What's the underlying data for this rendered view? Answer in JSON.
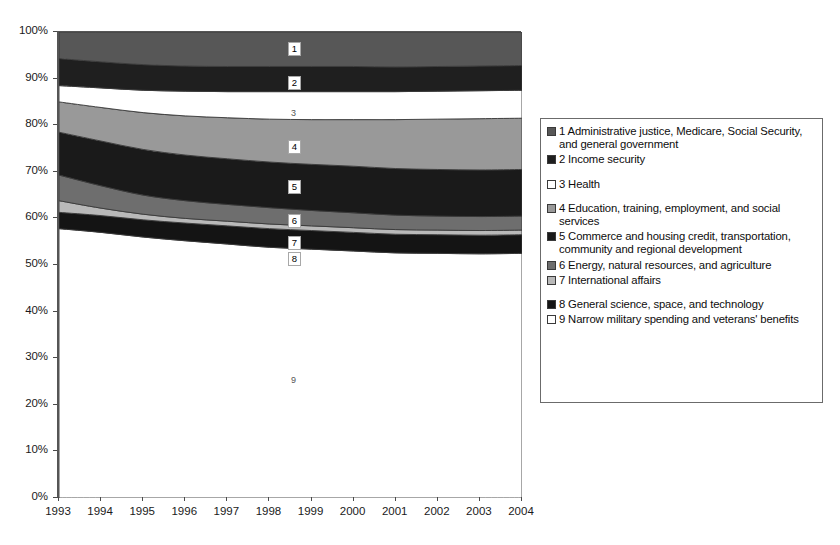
{
  "chart_data": {
    "type": "area",
    "stacked": true,
    "normalized": true,
    "title": "",
    "subtitle": "",
    "xlabel": "",
    "ylabel": "",
    "xlim": [
      1993,
      2004
    ],
    "ylim": [
      0,
      100
    ],
    "grid": false,
    "legend_position": "right",
    "x": [
      1993,
      1994,
      1995,
      1996,
      1997,
      1998,
      1999,
      2000,
      2001,
      2002,
      2003,
      2004
    ],
    "x_tick_labels": [
      "1993",
      "1994",
      "1995",
      "1996",
      "1997",
      "1998",
      "1999",
      "2000",
      "2001",
      "2002",
      "2003",
      "2004"
    ],
    "y_tick_labels": [
      "0%",
      "10%",
      "20%",
      "30%",
      "40%",
      "50%",
      "60%",
      "70%",
      "80%",
      "90%",
      "100%"
    ],
    "y_ticks": [
      0,
      10,
      20,
      30,
      40,
      50,
      60,
      70,
      80,
      90,
      100
    ],
    "series": [
      {
        "id": 9,
        "name": "Narrow military spending and veterans' benefits",
        "color": "#ffffff",
        "values": [
          57.8,
          57.0,
          56.0,
          55.2,
          54.5,
          53.8,
          53.4,
          53.0,
          52.6,
          52.5,
          52.4,
          52.5
        ],
        "cumulative_top": [
          57.8,
          57.0,
          56.0,
          55.2,
          54.5,
          53.8,
          53.4,
          53.0,
          52.6,
          52.5,
          52.4,
          52.5
        ]
      },
      {
        "id": 8,
        "name": "General science, space, and technology",
        "color": "#141414",
        "values": [
          3.5,
          3.6,
          3.7,
          3.8,
          3.9,
          4.0,
          4.0,
          4.0,
          4.0,
          4.0,
          4.0,
          4.0
        ],
        "cumulative_top": [
          61.3,
          60.6,
          59.7,
          59.0,
          58.4,
          57.8,
          57.4,
          57.0,
          56.6,
          56.5,
          56.4,
          56.5
        ]
      },
      {
        "id": 7,
        "name": "International affairs",
        "color": "#b9b9b9",
        "values": [
          2.5,
          1.6,
          1.2,
          1.0,
          1.0,
          1.0,
          1.0,
          1.0,
          1.0,
          1.0,
          1.0,
          1.0
        ],
        "cumulative_top": [
          63.8,
          62.2,
          60.9,
          60.0,
          59.4,
          58.8,
          58.4,
          58.0,
          57.6,
          57.5,
          57.4,
          57.5
        ]
      },
      {
        "id": 6,
        "name": "Energy, natural resources,  and agriculture",
        "color": "#6e6e6e",
        "values": [
          5.5,
          4.8,
          4.1,
          3.8,
          3.6,
          3.5,
          3.3,
          3.2,
          3.1,
          3.0,
          3.0,
          3.0
        ],
        "cumulative_top": [
          69.3,
          67.0,
          65.0,
          63.8,
          63.0,
          62.3,
          61.7,
          61.2,
          60.7,
          60.5,
          60.4,
          60.5
        ]
      },
      {
        "id": 5,
        "name": "Commerce and housing credit, transportation, community and regional development",
        "color": "#1a1a1a",
        "values": [
          9.2,
          9.6,
          9.8,
          9.8,
          9.8,
          9.8,
          9.9,
          10.0,
          10.0,
          10.0,
          10.0,
          10.0
        ],
        "cumulative_top": [
          78.5,
          76.6,
          74.8,
          73.6,
          72.8,
          72.1,
          71.6,
          71.2,
          70.7,
          70.5,
          70.4,
          70.5
        ]
      },
      {
        "id": 4,
        "name": "Education, training, employment, and social services",
        "color": "#999999",
        "values": [
          6.5,
          7.2,
          7.9,
          8.4,
          8.8,
          9.2,
          9.6,
          10.0,
          10.5,
          10.8,
          11.0,
          11.0
        ],
        "cumulative_top": [
          85.0,
          83.8,
          82.7,
          82.0,
          81.6,
          81.3,
          81.2,
          81.2,
          81.2,
          81.3,
          81.4,
          81.5
        ]
      },
      {
        "id": 3,
        "name": "Health",
        "color": "#ffffff",
        "values": [
          3.5,
          4.2,
          4.8,
          5.3,
          5.6,
          5.9,
          6.0,
          6.0,
          6.0,
          6.0,
          6.0,
          6.0
        ],
        "cumulative_top": [
          88.5,
          88.0,
          87.5,
          87.3,
          87.2,
          87.2,
          87.2,
          87.2,
          87.2,
          87.3,
          87.4,
          87.5
        ]
      },
      {
        "id": 2,
        "name": "Income security",
        "color": "#1f1f1f",
        "values": [
          5.8,
          5.6,
          5.5,
          5.4,
          5.4,
          5.4,
          5.4,
          5.4,
          5.3,
          5.3,
          5.3,
          5.3
        ],
        "cumulative_top": [
          94.3,
          93.6,
          93.0,
          92.7,
          92.6,
          92.6,
          92.6,
          92.6,
          92.5,
          92.6,
          92.7,
          92.8
        ]
      },
      {
        "id": 1,
        "name": "Administrative justice, Medicare, Social Security, and general government",
        "color": "#575757",
        "values": [
          5.7,
          6.4,
          7.0,
          7.3,
          7.4,
          7.4,
          7.4,
          7.4,
          7.5,
          7.4,
          7.3,
          7.2
        ],
        "cumulative_top": [
          100,
          100,
          100,
          100,
          100,
          100,
          100,
          100,
          100,
          100,
          100,
          100
        ]
      }
    ],
    "band_number_labels": [
      {
        "id": "1",
        "text": "1",
        "x_px": 288,
        "y_px": 42,
        "boxed": true
      },
      {
        "id": "2",
        "text": "2",
        "x_px": 288,
        "y_px": 76,
        "boxed": true
      },
      {
        "id": "3",
        "text": "3",
        "x_px": 288,
        "y_px": 107,
        "boxed": false
      },
      {
        "id": "4",
        "text": "4",
        "x_px": 288,
        "y_px": 140,
        "boxed": true
      },
      {
        "id": "5",
        "text": "5",
        "x_px": 288,
        "y_px": 180,
        "boxed": true
      },
      {
        "id": "6",
        "text": "6",
        "x_px": 288,
        "y_px": 214,
        "boxed": true
      },
      {
        "id": "7",
        "text": "7",
        "x_px": 288,
        "y_px": 236,
        "boxed": true
      },
      {
        "id": "8",
        "text": "8",
        "x_px": 288,
        "y_px": 252,
        "boxed": true
      },
      {
        "id": "9",
        "text": "9",
        "x_px": 288,
        "y_px": 374,
        "boxed": false
      }
    ]
  },
  "legend": {
    "items": [
      {
        "num": "1",
        "label": "1 Administrative justice, Medicare, Social Security, and general government",
        "color": "#575757"
      },
      {
        "num": "2",
        "label": "2 Income security",
        "color": "#1f1f1f"
      },
      {
        "num": "3",
        "label": "3 Health",
        "color": "#ffffff"
      },
      {
        "num": "4",
        "label": "4 Education, training, employment, and social services",
        "color": "#999999"
      },
      {
        "num": "5",
        "label": "5 Commerce and housing credit, transportation, community and regional development",
        "color": "#1a1a1a"
      },
      {
        "num": "6",
        "label": "6 Energy, natural resources,  and agriculture",
        "color": "#6e6e6e"
      },
      {
        "num": "7",
        "label": "7 International affairs",
        "color": "#b9b9b9"
      },
      {
        "num": "8",
        "label": "8 General science, space, and technology",
        "color": "#141414"
      },
      {
        "num": "9",
        "label": "9 Narrow military spending and veterans' benefits",
        "color": "#ffffff"
      }
    ]
  }
}
